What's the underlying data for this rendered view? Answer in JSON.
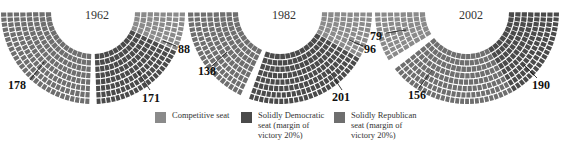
{
  "chart_data": [
    {
      "type": "hemicycle",
      "title": "1962",
      "series": [
        {
          "name": "Solidly Republican seat (margin of victory 20%)",
          "value": 178,
          "position": "left"
        },
        {
          "name": "Solidly Democratic seat (margin of victory 20%)",
          "value": 171,
          "position": "right"
        },
        {
          "name": "Competitive seat",
          "value": 88,
          "position": "upper-right"
        }
      ]
    },
    {
      "type": "hemicycle",
      "title": "1982",
      "series": [
        {
          "name": "Solidly Republican seat (margin of victory 20%)",
          "value": 138,
          "position": "left"
        },
        {
          "name": "Solidly Democratic seat (margin of victory 20%)",
          "value": 201,
          "position": "right"
        },
        {
          "name": "Competitive seat",
          "value": 96,
          "position": "upper-right"
        }
      ]
    },
    {
      "type": "hemicycle",
      "title": "2002",
      "series": [
        {
          "name": "Solidly Republican seat (margin of victory 20%)",
          "value": 156,
          "position": "lower-left"
        },
        {
          "name": "Solidly Democratic seat (margin of victory 20%)",
          "value": 190,
          "position": "right"
        },
        {
          "name": "Competitive seat",
          "value": 79,
          "position": "upper-left"
        }
      ]
    }
  ],
  "charts": [
    {
      "year": "1962",
      "left": "178",
      "right": "171",
      "competitive": "88"
    },
    {
      "year": "1982",
      "left": "138",
      "right": "201",
      "competitive": "96"
    },
    {
      "year": "2002",
      "left": "156",
      "right": "190",
      "competitive": "79"
    }
  ],
  "legend": {
    "competitive": "Competitive seat",
    "democratic": [
      "Solidly Democratic",
      "seat (margin of",
      "victory 20%)"
    ],
    "republican": [
      "Solidly Republican",
      "seat (margin of",
      "victory 20%)"
    ]
  },
  "colors": {
    "competitive": "#8a8a8a",
    "democratic": "#4a4a4a",
    "republican": "#6e6e6e"
  }
}
